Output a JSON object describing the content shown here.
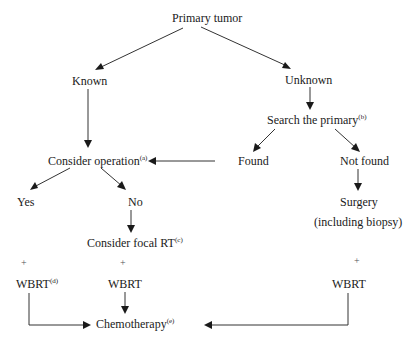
{
  "diagram": {
    "type": "flowchart",
    "nodes": {
      "primary_tumor": {
        "label": "Primary tumor"
      },
      "known": {
        "label": "Known"
      },
      "unknown": {
        "label": "Unknown"
      },
      "search_primary": {
        "label": "Search the primary",
        "note": "(b)"
      },
      "found": {
        "label": "Found"
      },
      "not_found": {
        "label": "Not found"
      },
      "consider_operation": {
        "label": "Consider operation",
        "note": "(a)"
      },
      "yes": {
        "label": "Yes"
      },
      "no": {
        "label": "No"
      },
      "surgery": {
        "label": "Surgery"
      },
      "including_biopsy": {
        "label": "(including biopsy)"
      },
      "consider_focal_rt": {
        "label": "Consider focal RT",
        "note": "(c)"
      },
      "plus_left": {
        "label": "+"
      },
      "plus_mid": {
        "label": "+"
      },
      "plus_right": {
        "label": "+"
      },
      "wbrt_left": {
        "label": "WBRT",
        "note": "(d)"
      },
      "wbrt_mid": {
        "label": "WBRT"
      },
      "wbrt_right": {
        "label": "WBRT"
      },
      "chemotherapy": {
        "label": "Chemotherapy",
        "note": "(e)"
      }
    },
    "edges": [
      {
        "from": "Primary tumor",
        "to": "Known"
      },
      {
        "from": "Primary tumor",
        "to": "Unknown"
      },
      {
        "from": "Known",
        "to": "Consider operation"
      },
      {
        "from": "Unknown",
        "to": "Search the primary"
      },
      {
        "from": "Search the primary",
        "to": "Found"
      },
      {
        "from": "Search the primary",
        "to": "Not found"
      },
      {
        "from": "Found",
        "to": "Consider operation"
      },
      {
        "from": "Not found",
        "to": "Surgery"
      },
      {
        "from": "Consider operation",
        "to": "Yes"
      },
      {
        "from": "Consider operation",
        "to": "No"
      },
      {
        "from": "No",
        "to": "Consider focal RT"
      },
      {
        "from": "WBRT (d)",
        "to": "Chemotherapy"
      },
      {
        "from": "WBRT",
        "to": "Chemotherapy"
      },
      {
        "from": "WBRT (right)",
        "to": "Chemotherapy"
      }
    ],
    "colors": {
      "line": "#333333",
      "text": "#1a1a1a",
      "background": "#ffffff"
    }
  }
}
